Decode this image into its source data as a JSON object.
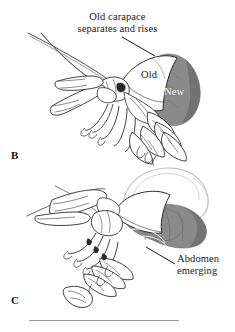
{
  "figure": {
    "type": "scientific-line-illustration",
    "background_color": "#ffffff",
    "ink_color": "#1a1a1a",
    "shading_color": "#8a8a8a",
    "ghost_outline_color": "#c9c9c9",
    "width": 235,
    "height": 332
  },
  "annotations": {
    "old_carapace_caption": {
      "line1": "Old carapace",
      "line2": "separates and rises"
    },
    "old_label": "Old",
    "new_label": "New",
    "abdomen_caption": {
      "line1": "Abdomen",
      "line2": "emerging"
    }
  },
  "panels": [
    {
      "id": "B",
      "label": "B",
      "description": "Lobster with old carapace separating and rising, new gray carapace exposed beneath"
    },
    {
      "id": "C",
      "label": "C",
      "description": "Lobster with abdomen emerging from the shed carapace"
    }
  ],
  "rule": {
    "present": true,
    "color": "#9a9a9a"
  },
  "icons": {
    "leader_line_top": "leader-line-icon",
    "leader_line_bottom": "leader-line-icon"
  }
}
